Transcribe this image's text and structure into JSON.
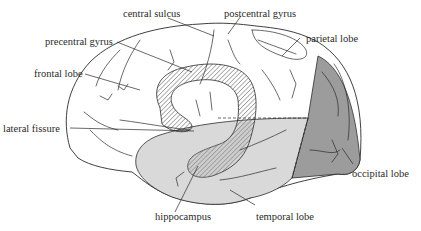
{
  "diagram": {
    "type": "anatomical-illustration",
    "colors": {
      "background": "#ffffff",
      "line": "#2a2a2a",
      "temporal_lobe_fill": "#d9d9d9",
      "occipital_lobe_fill": "#9c9c9c",
      "hatch": "#3a3a3a"
    },
    "labels": {
      "central_sulcus": "central sulcus",
      "postcentral_gyrus": "postcentral gyrus",
      "precentral_gyrus": "precentral gyrus",
      "parietal_lobe": "parietal lobe",
      "frontal_lobe": "frontal lobe",
      "lateral_fissure": "lateral fissure",
      "occipital_lobe": "occipital lobe",
      "hippocampus": "hippocampus",
      "temporal_lobe": "temporal lobe"
    }
  }
}
